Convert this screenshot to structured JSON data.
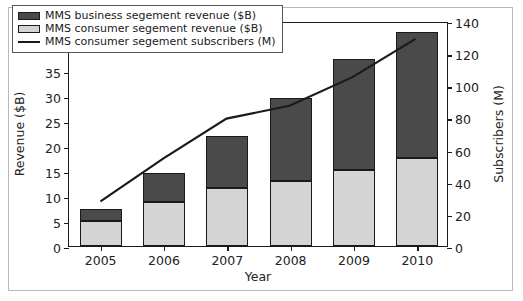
{
  "chart_data": {
    "type": "bar",
    "title": "",
    "xlabel": "Year",
    "ylabel": "Revenue ($B)",
    "y2label": "Subscribers (M)",
    "categories": [
      "2005",
      "2006",
      "2007",
      "2008",
      "2009",
      "2010"
    ],
    "ylim": [
      0,
      45
    ],
    "yticks": [
      0,
      5,
      10,
      15,
      20,
      25,
      30,
      35,
      40,
      45
    ],
    "y2lim": [
      0,
      140
    ],
    "y2ticks": [
      0,
      20,
      40,
      60,
      80,
      100,
      120,
      140
    ],
    "grid": false,
    "legend_position": "upper left",
    "stacked": true,
    "series": [
      {
        "name": "MMS business segement revenue ($B)",
        "type": "bar",
        "axis": "left",
        "color": "#4a4a4a",
        "values": [
          2.5,
          5.8,
          10.4,
          16.6,
          22.2,
          25.1
        ]
      },
      {
        "name": "MMS consumer segement revenue ($B)",
        "type": "bar",
        "axis": "left",
        "color": "#d4d4d4",
        "values": [
          5.0,
          8.8,
          11.7,
          13.1,
          15.2,
          17.7
        ]
      },
      {
        "name": "MMS consumer segement subscribers (M)",
        "type": "line",
        "axis": "right",
        "color": "#1a1a1a",
        "values": [
          28,
          55,
          80,
          88,
          106,
          130
        ]
      }
    ],
    "totals": [
      7.5,
      14.6,
      22.1,
      29.7,
      37.4,
      42.8
    ]
  },
  "axes": {
    "left_title": "Revenue ($B)",
    "right_title": "Subscribers (M)",
    "bottom_title": "Year"
  },
  "legend": {
    "items": [
      {
        "label": "MMS business segement revenue ($B)",
        "key": "swatch-dark"
      },
      {
        "label": "MMS consumer segement revenue ($B)",
        "key": "swatch-light"
      },
      {
        "label": "MMS consumer segement subscribers (M)",
        "key": "line-black"
      }
    ]
  },
  "colors": {
    "business": "#4a4a4a",
    "consumer": "#d4d4d4",
    "line": "#1a1a1a",
    "axis": "#1a1a1a",
    "background": "#ffffff"
  }
}
